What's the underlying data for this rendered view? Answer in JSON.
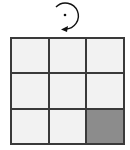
{
  "rotation": {
    "icon": "rotate-clockwise-icon",
    "direction": "clockwise",
    "color": "#111111"
  },
  "grid": {
    "rows": 3,
    "cols": 3,
    "cell_color": "#f2f2f2",
    "filled_color": "#8c8c8c",
    "line_color": "#3a3a3a",
    "cells": [
      [
        0,
        0,
        0
      ],
      [
        0,
        0,
        0
      ],
      [
        0,
        0,
        1
      ]
    ]
  }
}
